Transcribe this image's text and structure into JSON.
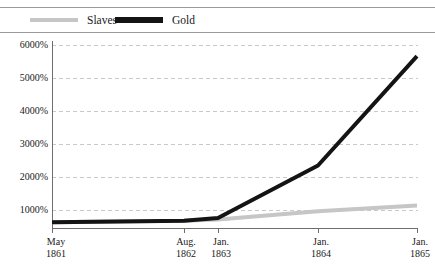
{
  "legend": {
    "position": "top",
    "items": [
      {
        "label": "Slaves",
        "color": "#c6c6c6",
        "name": "slaves"
      },
      {
        "label": "Gold",
        "color": "#141414",
        "name": "gold"
      }
    ]
  },
  "axes": {
    "y_ticks": [
      "1000%",
      "2000%",
      "3000%",
      "4000%",
      "5000%",
      "6000%"
    ],
    "x_ticks": [
      {
        "month": "May",
        "year": "1861"
      },
      {
        "month": "Aug.",
        "year": "1862"
      },
      {
        "month": "Jan.",
        "year": "1863"
      },
      {
        "month": "Jan.",
        "year": "1864"
      },
      {
        "month": "Jan.",
        "year": "1865"
      }
    ]
  },
  "chart_data": {
    "type": "line",
    "title": "",
    "subtitle": "",
    "xlabel": "",
    "ylabel": "",
    "x": [
      "May 1861",
      "Aug. 1862",
      "Jan. 1863",
      "Jan. 1864",
      "Jan. 1865"
    ],
    "ylim": [
      0,
      6500
    ],
    "yunit": "%",
    "ytick_values": [
      1000,
      2000,
      3000,
      4000,
      5000,
      6000
    ],
    "grid": "horizontal-dashed",
    "legend_position": "top",
    "series": [
      {
        "name": "Slaves",
        "color": "#c6c6c6",
        "width": 4,
        "values": [
          100,
          150,
          200,
          500,
          700
        ]
      },
      {
        "name": "Gold",
        "color": "#141414",
        "width": 4,
        "values": [
          100,
          150,
          250,
          2150,
          6100
        ]
      }
    ]
  }
}
